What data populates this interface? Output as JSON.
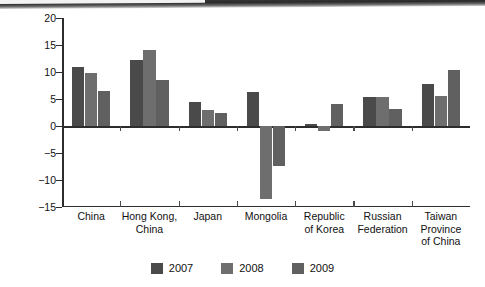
{
  "chart_data": {
    "type": "bar",
    "title": "",
    "subtitle": "",
    "xlabel": "",
    "ylabel": "Percentage of GDP",
    "ylim": [
      -15,
      20
    ],
    "yticks": [
      20,
      15,
      10,
      5,
      0,
      -5,
      -10,
      -15
    ],
    "ytick_labels": [
      "20",
      "15",
      "10",
      "5",
      "0",
      "−5",
      "−10",
      "−15"
    ],
    "grid": false,
    "legend_position": "bottom",
    "categories": [
      "China",
      "Hong Kong,\nChina",
      "Japan",
      "Mongolia",
      "Republic\nof Korea",
      "Russian\nFederation",
      "Taiwan\nProvince\nof China"
    ],
    "series": [
      {
        "name": "2007",
        "color": "#4a4a4a",
        "values": [
          11.0,
          12.2,
          4.5,
          6.3,
          0.3,
          5.3,
          7.8
        ]
      },
      {
        "name": "2008",
        "color": "#6e6e6e",
        "values": [
          9.9,
          14.0,
          3.0,
          -13.5,
          -1.0,
          5.3,
          5.5
        ]
      },
      {
        "name": "2009",
        "color": "#606060",
        "values": [
          6.5,
          8.5,
          2.5,
          -7.4,
          4.0,
          3.2,
          10.4
        ]
      }
    ]
  },
  "legend": {
    "items": [
      {
        "label": "2007",
        "color": "#4a4a4a"
      },
      {
        "label": "2008",
        "color": "#6e6e6e"
      },
      {
        "label": "2009",
        "color": "#606060"
      }
    ]
  }
}
